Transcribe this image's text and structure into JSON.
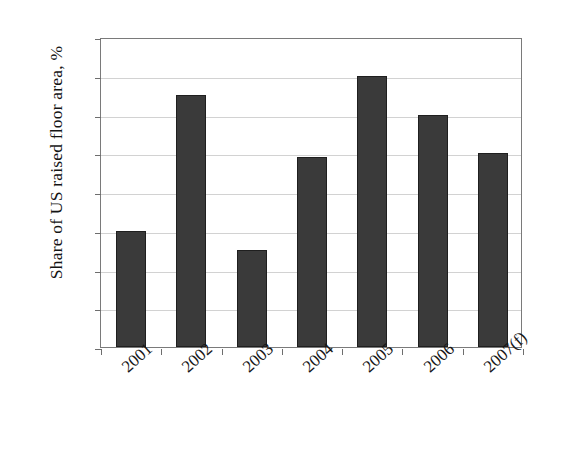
{
  "chart_data": {
    "type": "bar",
    "title": "",
    "subtitle": "",
    "xlabel": "",
    "ylabel": "Share of US raised floor area, %",
    "categories": [
      "2001",
      "2002",
      "2003",
      "2004",
      "2005",
      "2006",
      "2007(f)"
    ],
    "values": [
      41.0,
      44.5,
      40.5,
      42.9,
      45.0,
      44.0,
      43.0
    ],
    "ylim": [
      38,
      46
    ],
    "ytick_step": 1,
    "yticks": [
      "46",
      "45",
      "44",
      "43",
      "42",
      "41",
      "40",
      "39",
      "38"
    ],
    "grid": "horizontal",
    "legend": "none",
    "series": [
      {
        "name": "Share of US raised floor area",
        "values": [
          41.0,
          44.5,
          40.5,
          42.9,
          45.0,
          44.0,
          43.0
        ]
      }
    ],
    "colors": {
      "bar_fill": "#3a3a3a",
      "bar_border": "#1f1f1f",
      "gridline": "#d2d2d2",
      "axis": "#7a7a7a",
      "background": "#ffffff",
      "text": "#171717"
    },
    "xlabel_rotation_deg": -42
  }
}
